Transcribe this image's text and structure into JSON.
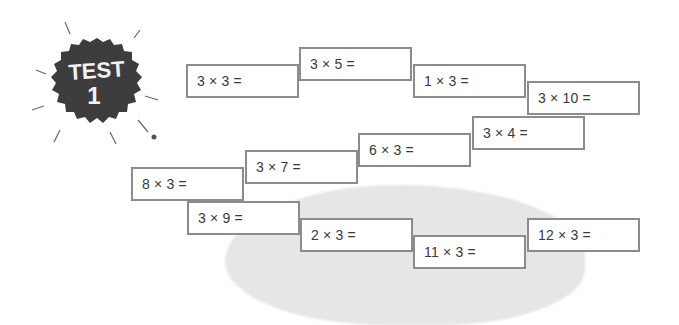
{
  "badge": {
    "line1": "TEST",
    "line2": "1",
    "color": "#3d3d3d"
  },
  "problems": [
    {
      "label": "3 × 3 =",
      "x": 186,
      "y": 64
    },
    {
      "label": "3 × 5 =",
      "x": 299,
      "y": 47
    },
    {
      "label": "1 × 3 =",
      "x": 413,
      "y": 64
    },
    {
      "label": "3 × 10 =",
      "x": 527,
      "y": 81
    },
    {
      "label": "3 × 4 =",
      "x": 472,
      "y": 116
    },
    {
      "label": "6 × 3 =",
      "x": 358,
      "y": 133
    },
    {
      "label": "3 × 7 =",
      "x": 245,
      "y": 150
    },
    {
      "label": "8 × 3 =",
      "x": 131,
      "y": 167
    },
    {
      "label": "3 × 9 =",
      "x": 187,
      "y": 201
    },
    {
      "label": "2 × 3 =",
      "x": 300,
      "y": 218
    },
    {
      "label": "11 × 3 =",
      "x": 413,
      "y": 235
    },
    {
      "label": "12 × 3 =",
      "x": 527,
      "y": 218
    }
  ]
}
